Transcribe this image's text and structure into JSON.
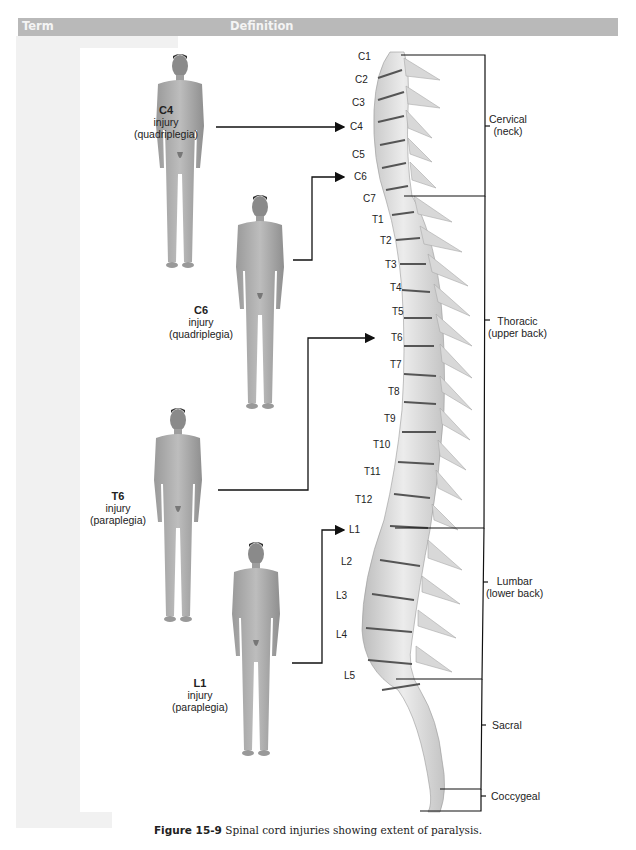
{
  "header": {
    "term_label": "Term",
    "definition_label": "Definition",
    "color": "#b9b9b9"
  },
  "figure": {
    "injuries": [
      {
        "level": "C4",
        "line1": "injury",
        "line2": "(quadriplegia)",
        "target": "C4"
      },
      {
        "level": "C6",
        "line1": "injury",
        "line2": "(quadriplegia)",
        "target": "C6"
      },
      {
        "level": "T6",
        "line1": "injury",
        "line2": "(paraplegia)",
        "target": "T6"
      },
      {
        "level": "L1",
        "line1": "injury",
        "line2": "(paraplegia)",
        "target": "L1"
      }
    ],
    "vertebrae": [
      "C1",
      "C2",
      "C3",
      "C4",
      "C5",
      "C6",
      "C7",
      "T1",
      "T2",
      "T3",
      "T4",
      "T5",
      "T6",
      "T7",
      "T8",
      "T9",
      "T10",
      "T11",
      "T12",
      "L1",
      "L2",
      "L3",
      "L4",
      "L5"
    ],
    "regions": [
      {
        "name": "Cervical",
        "sub": "(neck)"
      },
      {
        "name": "Thoracic",
        "sub": "(upper back)"
      },
      {
        "name": "Lumbar",
        "sub": "(lower back)"
      },
      {
        "name": "Sacral",
        "sub": ""
      },
      {
        "name": "Coccygeal",
        "sub": ""
      }
    ],
    "caption_number": "Figure 15-9",
    "caption_text": " Spinal cord injuries showing extent of paralysis."
  }
}
